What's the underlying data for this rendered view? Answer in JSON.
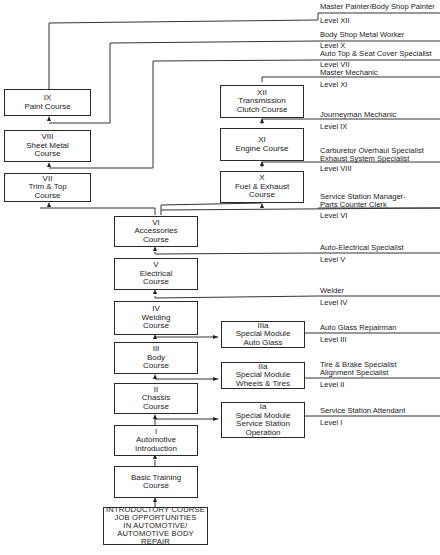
{
  "courses": {
    "intro": {
      "line1": "INTRODUCTORY COURSE",
      "line2": "JOB OPPORTUNITIES",
      "line3": "IN AUTOMOTIVE/",
      "line4": "AUTOMOTIVE BODY REPAIR"
    },
    "basic": {
      "line1": "Basic Training",
      "line2": "Course"
    },
    "c1": {
      "num": "I",
      "line1": "Automotive",
      "line2": "Introduction"
    },
    "c2": {
      "num": "II",
      "line1": "Chassis",
      "line2": "Course"
    },
    "c3": {
      "num": "III",
      "line1": "Body",
      "line2": "Course"
    },
    "c4": {
      "num": "IV",
      "line1": "Welding",
      "line2": "Course"
    },
    "c5": {
      "num": "V",
      "line1": "Electrical",
      "line2": "Course"
    },
    "c6": {
      "num": "VI",
      "line1": "Accessories",
      "line2": "Course"
    },
    "c7": {
      "num": "VII",
      "line1": "Trim & Top",
      "line2": "Course"
    },
    "c8": {
      "num": "VIII",
      "line1": "Sheet Metal",
      "line2": "Course"
    },
    "c9": {
      "num": "IX",
      "line1": "Paint Course"
    },
    "c10": {
      "num": "X",
      "line1": "Fuel & Exhaust",
      "line2": "Course"
    },
    "c11": {
      "num": "XI",
      "line1": "Engine Course"
    },
    "c12": {
      "num": "XII",
      "line1": "Transmission",
      "line2": "Clutch Course"
    },
    "m1a": {
      "num": "Ia",
      "line1": "Special Module",
      "line2": "Service Station",
      "line3": "Operation"
    },
    "m2a": {
      "num": "IIa",
      "line1": "Special Module",
      "line2": "Wheels & Tires"
    },
    "m3a": {
      "num": "IIIa",
      "line1": "Special Module",
      "line2": "Auto Glass"
    }
  },
  "careers": [
    {
      "title": "Master Painter/Body Shop Painter",
      "level": "Level XII"
    },
    {
      "title": "Body Shop Metal Worker",
      "level": "Level X"
    },
    {
      "title": "Auto Top & Seat Cover Specialist",
      "level": "Level VII"
    },
    {
      "title": "Master Mechanic",
      "level": "Level XI"
    },
    {
      "title": "Journeyman Mechanic",
      "level": "Level IX"
    },
    {
      "title": "Carburetor Overhaul Specialist",
      "title2": "Exhaust System Specialist",
      "level": "Level VIII"
    },
    {
      "title": "Service Station Manager-",
      "title2": "Parts Counter Clerk",
      "level": "Level VI"
    },
    {
      "title": "Auto-Electrical Specialist",
      "level": "Level V"
    },
    {
      "title": "Welder",
      "level": "Level IV"
    },
    {
      "title": "Auto Glass Repairman",
      "level": "Level III"
    },
    {
      "title": "Tire & Brake Specialist",
      "title2": "Alignment Specialist",
      "level": "Level II"
    },
    {
      "title": "Service Station Attendant",
      "level": "Level I"
    }
  ]
}
